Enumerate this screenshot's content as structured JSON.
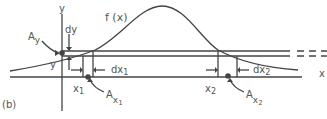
{
  "figure": {
    "panel_label": "(b)",
    "curve_label": "f (x)",
    "axes": {
      "x_label": "x",
      "y_label": "y"
    },
    "labels": {
      "dy": "dy",
      "y": "y",
      "Ay_main": "A",
      "Ay_sub": "y",
      "x1": "x",
      "x1_sub": "1",
      "x2": "x",
      "x2_sub": "2",
      "dx1": "dx",
      "dx1_sub": "1",
      "dx2": "dx",
      "dx2_sub": "2",
      "Ax1_main": "A",
      "Ax1_sub": "x",
      "Ax1_subsub": "1",
      "Ax2_main": "A",
      "Ax2_sub": "x",
      "Ax2_subsub": "2"
    },
    "colors": {
      "line": "#444444",
      "text": "#555555",
      "background": "#ffffff"
    }
  }
}
